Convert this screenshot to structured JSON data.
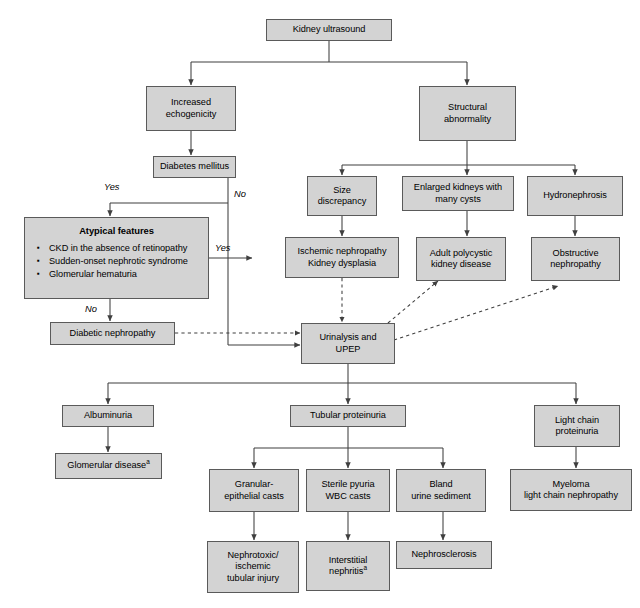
{
  "figure": {
    "kind": "clinical-diagnostic-flowchart",
    "title_text": "Kidney ultrasound",
    "stroke_color": "#3f3f3f",
    "box_fill": "#d3d3d3",
    "box_border": "#5a5a5a",
    "background": "#ffffff"
  },
  "nodes": {
    "kidney_ultrasound": {
      "label": "Kidney ultrasound"
    },
    "increased_echogenicity": {
      "line1": "Increased",
      "line2": "echogenicity"
    },
    "structural_abnormality": {
      "line1": "Structural",
      "line2": "abnormality"
    },
    "diabetes_mellitus": {
      "label": "Diabetes mellitus"
    },
    "atypical_features": {
      "title": "Atypical features",
      "bullets": [
        "CKD in the absence of retinopathy",
        "Sudden-onset nephrotic syndrome",
        "Glomerular hematuria"
      ]
    },
    "diabetic_nephropathy": {
      "label": "Diabetic nephropathy"
    },
    "size_discrepancy": {
      "line1": "Size",
      "line2": "discrepancy"
    },
    "enlarged_kidneys": {
      "line1": "Enlarged kidneys with",
      "line2": "many cysts"
    },
    "hydronephrosis": {
      "label": "Hydronephrosis"
    },
    "ischemic_nephropathy": {
      "line1": "Ischemic nephropathy",
      "line2": "Kidney dysplasia"
    },
    "adult_polycystic": {
      "line1": "Adult polycystic",
      "line2": "kidney disease"
    },
    "obstructive_nephropathy": {
      "line1": "Obstructive",
      "line2": "nephropathy"
    },
    "urinalysis_upep": {
      "line1": "Urinalysis and",
      "line2": "UPEP"
    },
    "albuminuria": {
      "label": "Albuminuria"
    },
    "tubular_proteinuria": {
      "label": "Tubular proteinuria"
    },
    "light_chain_proteinuria": {
      "line1": "Light chain",
      "line2": "proteinuria"
    },
    "glomerular_disease": {
      "label": "Glomerular disease",
      "footnote": "a"
    },
    "granular_casts": {
      "line1": "Granular-",
      "line2": "epithelial casts"
    },
    "sterile_pyuria": {
      "line1": "Sterile pyuria",
      "line2": "WBC casts"
    },
    "bland_sediment": {
      "line1": "Bland",
      "line2": "urine sediment"
    },
    "myeloma": {
      "line1": "Myeloma",
      "line2": "light chain nephropathy"
    },
    "nephrotoxic_injury": {
      "line1": "Nephrotoxic/",
      "line2": "ischemic",
      "line3": "tubular injury"
    },
    "interstitial_nephritis": {
      "line1": "Interstitial",
      "line2": "nephritis",
      "footnote": "a"
    },
    "nephrosclerosis": {
      "label": "Nephrosclerosis"
    }
  },
  "edge_labels": {
    "yes_to_atypical": "Yes",
    "no_from_diabetes": "No",
    "yes_from_atypical": "Yes",
    "no_from_atypical": "No"
  }
}
